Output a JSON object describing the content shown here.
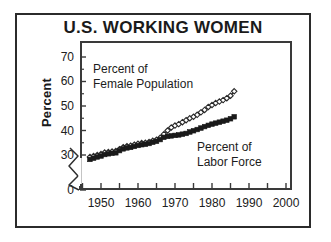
{
  "figure": {
    "title": "U.S. WORKING WOMEN",
    "border_color": "#2b2b2b",
    "background": "#ffffff",
    "ink_color": "#1a1a1a"
  },
  "axes": {
    "ylabel": "Percent",
    "ytick_labels": [
      "70",
      "60",
      "50",
      "40",
      "30",
      "0"
    ],
    "xtick_labels": [
      "1950",
      "1960",
      "1970",
      "1980",
      "1990",
      "2000"
    ],
    "y_axis_break": true,
    "y_break_note": "zigzag break between 0 and 30"
  },
  "annotations": {
    "female_population": {
      "line1": "Percent of",
      "line2": "Female Population"
    },
    "labor_force": {
      "line1": "Percent of",
      "line2": "Labor Force"
    }
  },
  "chart_data": {
    "type": "line",
    "title": "U.S. WORKING WOMEN",
    "subtitle": "",
    "xlabel": "",
    "ylabel": "Percent",
    "xlim": [
      1944,
      2001
    ],
    "ylim": [
      28,
      75
    ],
    "y_displayed_ticks": [
      0,
      30,
      40,
      50,
      60,
      70
    ],
    "y_axis_break_between": [
      0,
      30
    ],
    "x_major_ticks": [
      1950,
      1960,
      1970,
      1980,
      1990,
      2000
    ],
    "x_minor_tick_interval": 5,
    "grid": false,
    "legend": "inline annotations",
    "legend_position": "in-plot",
    "series": [
      {
        "name": "Percent of Female Population",
        "marker": "open-diamond",
        "color": "#2a2a2a",
        "x": [
          1947,
          1948,
          1949,
          1950,
          1951,
          1952,
          1953,
          1954,
          1955,
          1956,
          1957,
          1958,
          1959,
          1960,
          1961,
          1962,
          1963,
          1964,
          1965,
          1966,
          1967,
          1968,
          1969,
          1970,
          1971,
          1972,
          1973,
          1974,
          1975,
          1976,
          1977,
          1978,
          1979,
          1980,
          1981,
          1982,
          1983,
          1984,
          1985,
          1986
        ],
        "values": [
          29.2,
          29.6,
          30.0,
          30.4,
          31.0,
          31.2,
          31.4,
          31.6,
          32.4,
          33.2,
          33.6,
          33.8,
          34.2,
          34.6,
          34.9,
          35.0,
          35.3,
          35.8,
          36.2,
          37.0,
          38.5,
          40.0,
          41.2,
          42.0,
          42.6,
          43.4,
          44.2,
          45.0,
          45.6,
          46.4,
          47.4,
          48.4,
          49.6,
          50.4,
          51.2,
          51.8,
          52.4,
          53.2,
          54.2,
          56.0
        ]
      },
      {
        "name": "Percent of Labor Force",
        "marker": "filled-square",
        "color": "#1a1a1a",
        "x": [
          1947,
          1948,
          1949,
          1950,
          1951,
          1952,
          1953,
          1954,
          1955,
          1956,
          1957,
          1958,
          1959,
          1960,
          1961,
          1962,
          1963,
          1964,
          1965,
          1966,
          1967,
          1968,
          1969,
          1970,
          1971,
          1972,
          1973,
          1974,
          1975,
          1976,
          1977,
          1978,
          1979,
          1980,
          1981,
          1982,
          1983,
          1984,
          1985,
          1986
        ],
        "values": [
          28.2,
          28.7,
          29.2,
          29.6,
          30.2,
          30.5,
          30.7,
          30.9,
          31.8,
          32.5,
          32.9,
          33.1,
          33.5,
          33.9,
          34.2,
          34.4,
          34.7,
          35.2,
          35.6,
          36.3,
          37.2,
          37.6,
          37.8,
          38.0,
          38.2,
          38.5,
          38.8,
          39.4,
          39.9,
          40.4,
          41.0,
          41.6,
          42.1,
          42.6,
          43.0,
          43.4,
          43.8,
          44.2,
          44.8,
          45.6
        ]
      }
    ]
  }
}
